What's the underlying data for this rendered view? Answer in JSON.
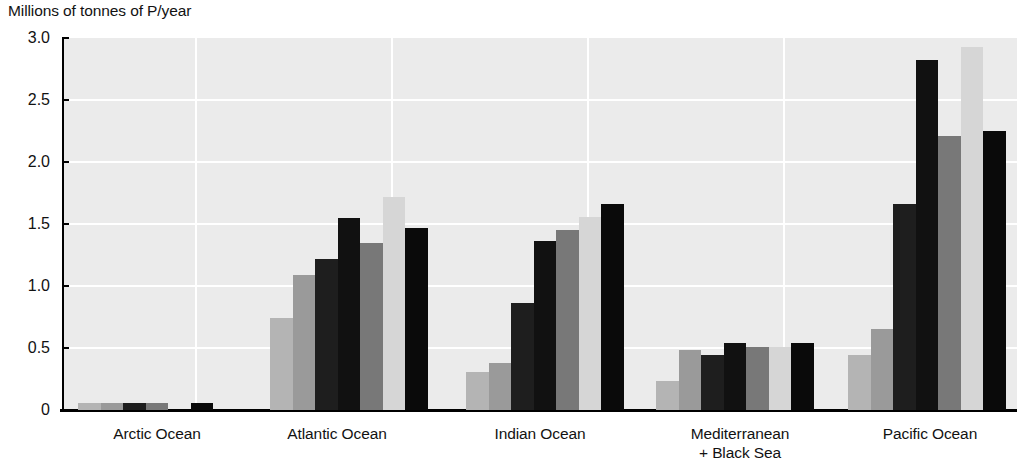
{
  "chart_data": {
    "type": "bar",
    "title": "Millions of tonnes of P/year",
    "xlabel": "",
    "ylabel": "Millions of tonnes of P/year",
    "ylim": [
      0,
      3.0
    ],
    "yticks": [
      "0",
      "0.5",
      "1.0",
      "1.5",
      "2.0",
      "2.5",
      "3.0"
    ],
    "ytick_values": [
      0,
      0.5,
      1.0,
      1.5,
      2.0,
      2.5,
      3.0
    ],
    "grid": "horizontal-and-vertical",
    "legend": "none",
    "categories": [
      "Arctic Ocean",
      "Atlantic Ocean",
      "Indian Ocean",
      "Mediterranean\n+ Black Sea",
      "Pacific Ocean"
    ],
    "category_lines": [
      [
        "Arctic Ocean"
      ],
      [
        "Atlantic Ocean"
      ],
      [
        "Indian Ocean"
      ],
      [
        "Mediterranean",
        "+ Black Sea"
      ],
      [
        "Pacific Ocean"
      ]
    ],
    "series": [
      {
        "name": "series-1",
        "color": "#b4b4b4",
        "values": [
          0.06,
          0.74,
          0.31,
          0.23,
          0.44
        ]
      },
      {
        "name": "series-2",
        "color": "#9a9a9a",
        "values": [
          0.06,
          1.09,
          0.38,
          0.48,
          0.65
        ]
      },
      {
        "name": "series-3",
        "color": "#1e1e1e",
        "values": [
          0.06,
          1.22,
          0.86,
          0.44,
          1.66
        ]
      },
      {
        "name": "series-4",
        "color": "#111111",
        "values": [
          0.0,
          1.55,
          1.36,
          0.54,
          2.82
        ]
      },
      {
        "name": "series-5",
        "color": "#787878",
        "values": [
          0.0,
          1.35,
          1.45,
          0.51,
          2.21
        ]
      },
      {
        "name": "series-6",
        "color": "#d6d6d6",
        "values": [
          0.0,
          1.72,
          1.56,
          0.0,
          2.93
        ]
      },
      {
        "name": "series-7",
        "color": "#0a0a0a",
        "values": [
          0.06,
          1.47,
          1.66,
          0.54,
          2.25
        ]
      }
    ],
    "bars_flat": [
      {
        "group": "Arctic Ocean",
        "index": 0,
        "value": 0.06,
        "color": "#b4b4b4"
      },
      {
        "group": "Arctic Ocean",
        "index": 1,
        "value": 0.06,
        "color": "#9a9a9a"
      },
      {
        "group": "Arctic Ocean",
        "index": 2,
        "value": 0.06,
        "color": "#1e1e1e"
      },
      {
        "group": "Arctic Ocean",
        "index": 3,
        "value": 0.06,
        "color": "#787878"
      },
      {
        "group": "Arctic Ocean",
        "index": 4,
        "value": 0.0,
        "color": "#d6d6d6"
      },
      {
        "group": "Arctic Ocean",
        "index": 5,
        "value": 0.06,
        "color": "#0a0a0a"
      },
      {
        "group": "Atlantic Ocean",
        "index": 0,
        "value": 0.74,
        "color": "#b4b4b4"
      },
      {
        "group": "Atlantic Ocean",
        "index": 1,
        "value": 1.09,
        "color": "#9a9a9a"
      },
      {
        "group": "Atlantic Ocean",
        "index": 2,
        "value": 1.22,
        "color": "#1e1e1e"
      },
      {
        "group": "Atlantic Ocean",
        "index": 3,
        "value": 1.55,
        "color": "#111111"
      },
      {
        "group": "Atlantic Ocean",
        "index": 4,
        "value": 1.35,
        "color": "#787878"
      },
      {
        "group": "Atlantic Ocean",
        "index": 5,
        "value": 1.72,
        "color": "#d6d6d6"
      },
      {
        "group": "Atlantic Ocean",
        "index": 6,
        "value": 1.47,
        "color": "#0a0a0a"
      },
      {
        "group": "Indian Ocean",
        "index": 0,
        "value": 0.31,
        "color": "#b4b4b4"
      },
      {
        "group": "Indian Ocean",
        "index": 1,
        "value": 0.38,
        "color": "#9a9a9a"
      },
      {
        "group": "Indian Ocean",
        "index": 2,
        "value": 0.86,
        "color": "#1e1e1e"
      },
      {
        "group": "Indian Ocean",
        "index": 3,
        "value": 1.36,
        "color": "#111111"
      },
      {
        "group": "Indian Ocean",
        "index": 4,
        "value": 1.45,
        "color": "#787878"
      },
      {
        "group": "Indian Ocean",
        "index": 5,
        "value": 1.56,
        "color": "#d6d6d6"
      },
      {
        "group": "Indian Ocean",
        "index": 6,
        "value": 1.66,
        "color": "#0a0a0a"
      },
      {
        "group": "Mediterranean + Black Sea",
        "index": 0,
        "value": 0.23,
        "color": "#b4b4b4"
      },
      {
        "group": "Mediterranean + Black Sea",
        "index": 1,
        "value": 0.48,
        "color": "#9a9a9a"
      },
      {
        "group": "Mediterranean + Black Sea",
        "index": 2,
        "value": 0.44,
        "color": "#1e1e1e"
      },
      {
        "group": "Mediterranean + Black Sea",
        "index": 3,
        "value": 0.54,
        "color": "#111111"
      },
      {
        "group": "Mediterranean + Black Sea",
        "index": 4,
        "value": 0.51,
        "color": "#787878"
      },
      {
        "group": "Mediterranean + Black Sea",
        "index": 5,
        "value": 0.51,
        "color": "#d6d6d6"
      },
      {
        "group": "Mediterranean + Black Sea",
        "index": 6,
        "value": 0.54,
        "color": "#0a0a0a"
      },
      {
        "group": "Pacific Ocean",
        "index": 0,
        "value": 0.44,
        "color": "#b4b4b4"
      },
      {
        "group": "Pacific Ocean",
        "index": 1,
        "value": 0.65,
        "color": "#9a9a9a"
      },
      {
        "group": "Pacific Ocean",
        "index": 2,
        "value": 1.66,
        "color": "#1e1e1e"
      },
      {
        "group": "Pacific Ocean",
        "index": 3,
        "value": 2.82,
        "color": "#111111"
      },
      {
        "group": "Pacific Ocean",
        "index": 4,
        "value": 2.21,
        "color": "#787878"
      },
      {
        "group": "Pacific Ocean",
        "index": 5,
        "value": 2.93,
        "color": "#d6d6d6"
      },
      {
        "group": "Pacific Ocean",
        "index": 6,
        "value": 2.25,
        "color": "#0a0a0a"
      }
    ]
  },
  "layout": {
    "plot_left": 62,
    "plot_top": 38,
    "plot_width": 953,
    "plot_height": 372,
    "bar_width": 22.5,
    "group_starts": [
      78,
      270,
      466,
      656,
      848
    ],
    "group_label_centers": [
      157,
      337,
      540,
      740,
      930
    ],
    "vgrid_x": [
      193,
      389,
      585,
      781
    ],
    "plot_bg": "#ebebeb",
    "grid_color": "#ffffff",
    "axis_color": "#000000"
  }
}
